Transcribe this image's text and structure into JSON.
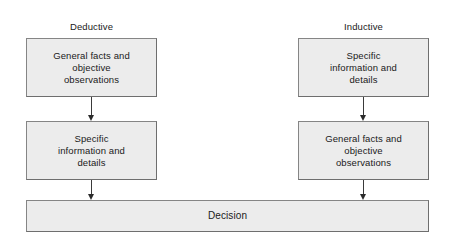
{
  "diagram": {
    "type": "flowchart",
    "canvas": {
      "width": 452,
      "height": 245,
      "background": "#ffffff"
    },
    "style": {
      "node_fill": "#ececec",
      "node_border": "#858585",
      "text_color": "#1a1a1a",
      "arrow_color": "#2b2b2b"
    },
    "columns": [
      {
        "id": "deductive",
        "heading_line1": "Deductive",
        "heading_line2": "Decision Making",
        "steps": [
          {
            "id": "l1",
            "text": "General facts and\nobjective\nobservations"
          },
          {
            "id": "l2",
            "text": "Specific\ninformation and\ndetails"
          }
        ]
      },
      {
        "id": "inductive",
        "heading_line1": "Inductive",
        "heading_line2": "Decision Making",
        "steps": [
          {
            "id": "r1",
            "text": "Specific\ninformation and\ndetails"
          },
          {
            "id": "r2",
            "text": "General facts and\nobjective\nobservations"
          }
        ]
      }
    ],
    "outcome": {
      "id": "decision",
      "text": "Decision"
    },
    "connectors": [
      {
        "id": "arrow-l1",
        "from": "l1",
        "to": "l2",
        "direction": "down"
      },
      {
        "id": "arrow-l2",
        "from": "l2",
        "to": "decision",
        "direction": "down"
      },
      {
        "id": "arrow-r1",
        "from": "r1",
        "to": "r2",
        "direction": "down"
      },
      {
        "id": "arrow-r2",
        "from": "r2",
        "to": "decision",
        "direction": "down"
      }
    ]
  }
}
